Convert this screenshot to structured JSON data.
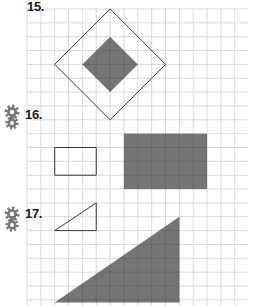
{
  "problems": [
    {
      "number": "15.",
      "has_challenge_icon": false,
      "description": "Outer square rotated 45° (outline) with inner shaded diamond"
    },
    {
      "number": "16.",
      "has_challenge_icon": true,
      "description": "Small outlined rectangle and larger shaded rectangle"
    },
    {
      "number": "17.",
      "has_challenge_icon": true,
      "description": "Small outlined right triangle and larger shaded right triangle"
    }
  ],
  "icons": {
    "challenge": "gear-icon"
  },
  "colors": {
    "grid": "#d9d9d9",
    "shade": "#6e6e6e",
    "outline": "#3a3a3a",
    "label": "#1a1a1a",
    "gear": "#777777"
  },
  "grid_units": {
    "shapes": [
      {
        "id": "outer-diamond",
        "kind": "outline",
        "points": [
          [
            6,
            0
          ],
          [
            2,
            4
          ],
          [
            6,
            8
          ],
          [
            10,
            4
          ]
        ]
      },
      {
        "id": "inner-diamond",
        "kind": "shaded",
        "points": [
          [
            6,
            2
          ],
          [
            4,
            4
          ],
          [
            6,
            6
          ],
          [
            8,
            4
          ]
        ]
      },
      {
        "id": "small-rectangle",
        "kind": "outline",
        "points": [
          [
            2,
            10
          ],
          [
            5,
            10
          ],
          [
            5,
            12
          ],
          [
            2,
            12
          ]
        ]
      },
      {
        "id": "large-rectangle",
        "kind": "shaded",
        "points": [
          [
            7,
            9
          ],
          [
            13,
            9
          ],
          [
            13,
            13
          ],
          [
            7,
            13
          ]
        ]
      },
      {
        "id": "small-triangle",
        "kind": "outline",
        "points": [
          [
            2,
            16
          ],
          [
            5,
            14
          ],
          [
            5,
            16
          ]
        ]
      },
      {
        "id": "large-triangle",
        "kind": "shaded",
        "points": [
          [
            2,
            21.2
          ],
          [
            11,
            15
          ],
          [
            11,
            21.2
          ]
        ]
      }
    ]
  }
}
